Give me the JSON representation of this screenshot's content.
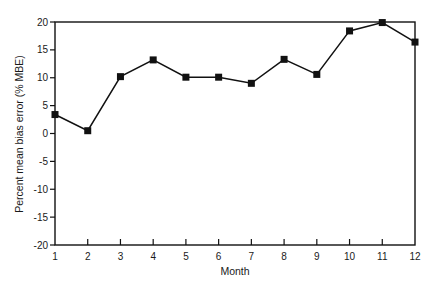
{
  "chart_data": {
    "type": "line",
    "title": "",
    "xlabel": "Month",
    "ylabel": "Percent mean bias error (% MBE)",
    "x": [
      1,
      2,
      3,
      4,
      5,
      6,
      7,
      8,
      9,
      10,
      11,
      12
    ],
    "categories": [
      "1",
      "2",
      "3",
      "4",
      "5",
      "6",
      "7",
      "8",
      "9",
      "10",
      "11",
      "12"
    ],
    "series": [
      {
        "name": "% MBE",
        "marker": "square",
        "values": [
          3.4,
          0.5,
          10.2,
          13.2,
          10.1,
          10.1,
          9.0,
          13.3,
          10.6,
          18.4,
          19.9,
          16.4
        ]
      }
    ],
    "ylim": [
      -20,
      20
    ],
    "xlim": [
      1,
      12
    ],
    "yticks": [
      "20",
      "15",
      "10",
      "5",
      "0",
      "-5",
      "-10",
      "-15",
      "-20"
    ],
    "grid": false,
    "legend": null,
    "colors": {
      "line": "#111111",
      "axis": "#111111"
    }
  }
}
